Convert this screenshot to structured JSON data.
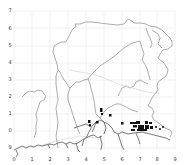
{
  "map": {
    "title": "",
    "x_axis": {
      "ticks": [
        "0",
        "1",
        "2",
        "3",
        "4",
        "5",
        "6",
        "7",
        "8",
        "9"
      ]
    },
    "y_axis": {
      "ticks": [
        "7",
        "6",
        "5",
        "4",
        "3",
        "2",
        "1",
        "0",
        "9"
      ]
    },
    "grid": true,
    "colors": {
      "background": "#ffffff",
      "grid": "#e6e6e6",
      "boundary": "#8a8a8a",
      "coast": "#555555",
      "markers": "#111111"
    },
    "features": {
      "boundary_lines": "region outline and internal district boundaries",
      "coastline": "southern coastline with estuaries",
      "markers": "black filled blocks clustered near coast around x=6.5-7.5, y=0"
    }
  }
}
